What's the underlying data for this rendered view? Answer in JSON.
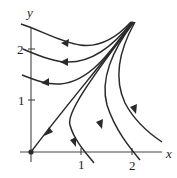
{
  "figure": {
    "type": "phase-portrait",
    "axes": {
      "x_label": "x",
      "y_label": "y",
      "x_ticks": [
        {
          "value": 1,
          "label": "1"
        },
        {
          "value": 2,
          "label": "2"
        }
      ],
      "y_ticks": [
        {
          "value": 1,
          "label": "1"
        },
        {
          "value": 2,
          "label": "2"
        }
      ]
    },
    "equilibrium": {
      "x": 0,
      "y": 0,
      "label": ""
    },
    "trajectories": [
      {
        "id": "top-left-arc",
        "description": "curve from upper-right convergence point sweeping left toward y≈2.6 at x<0",
        "arrow_direction": "left"
      },
      {
        "id": "mid-left-arc",
        "description": "curve from upper-right to left, crossing y-axis near y≈2",
        "arrow_direction": "left"
      },
      {
        "id": "low-left-arc",
        "description": "curve from upper-right to left, crossing y-axis near y≈1",
        "arrow_direction": "left"
      },
      {
        "id": "separatrix-to-origin",
        "description": "straight trajectory into the origin",
        "arrow_direction": "down-left"
      },
      {
        "id": "inner-right-arc",
        "description": "curve bending down to cross x-axis near x≈1",
        "arrow_direction": "down-right"
      },
      {
        "id": "middle-right-arc",
        "description": "curve bending down to cross x-axis near x≈2",
        "arrow_direction": "down-right"
      },
      {
        "id": "outer-right-arc",
        "description": "curve bending down toward lower right beyond x≈2",
        "arrow_direction": "down-right"
      }
    ],
    "colors": {
      "ink": "#2a2a2a",
      "background": "#ffffff"
    }
  }
}
